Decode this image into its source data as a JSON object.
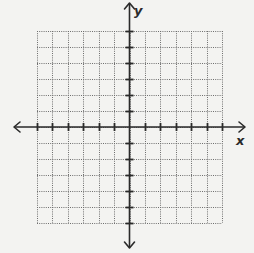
{
  "diagram": {
    "type": "coordinate-plane",
    "axes": {
      "x_label": "x",
      "y_label": "y",
      "arrows": "both-ends",
      "tick_marks": true,
      "numeric_labels": false
    },
    "grid": {
      "columns": 12,
      "rows": 12,
      "line_style": "dotted",
      "x_range": [
        -6,
        6
      ],
      "y_range": [
        -6,
        6
      ]
    },
    "colors": {
      "background": "#f3f3f1",
      "axis": "#2a2a2a",
      "grid": "#6e6e6e"
    }
  }
}
